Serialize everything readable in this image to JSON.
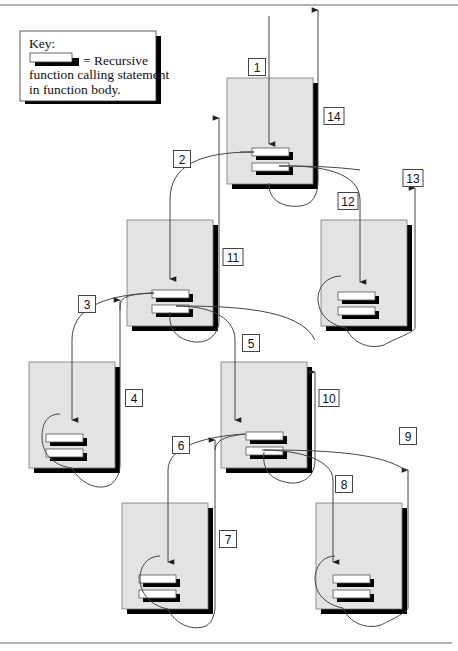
{
  "key": {
    "title": "Key:",
    "line1": "= Recursive",
    "line2": "function calling statement",
    "line3": "in function body."
  },
  "frames": [
    {
      "id": "call-1",
      "level": 1
    },
    {
      "id": "call-2",
      "level": 2
    },
    {
      "id": "call-3",
      "level": 2
    },
    {
      "id": "call-4",
      "level": 3
    },
    {
      "id": "call-5",
      "level": 3
    },
    {
      "id": "call-6",
      "level": 4
    },
    {
      "id": "call-7",
      "level": 4
    }
  ],
  "steps": [
    {
      "label": "1",
      "from": "caller",
      "to": "call-1",
      "kind": "call"
    },
    {
      "label": "2",
      "from": "call-1",
      "to": "call-2",
      "kind": "call"
    },
    {
      "label": "3",
      "from": "call-2",
      "to": "call-4",
      "kind": "call"
    },
    {
      "label": "4",
      "from": "call-4",
      "to": "call-2",
      "kind": "return"
    },
    {
      "label": "5",
      "from": "call-2",
      "to": "call-5",
      "kind": "call"
    },
    {
      "label": "6",
      "from": "call-5",
      "to": "call-6",
      "kind": "call"
    },
    {
      "label": "7",
      "from": "call-6",
      "to": "call-5",
      "kind": "return"
    },
    {
      "label": "8",
      "from": "call-5",
      "to": "call-7",
      "kind": "call"
    },
    {
      "label": "9",
      "from": "call-7",
      "to": "call-5",
      "kind": "return"
    },
    {
      "label": "10",
      "from": "call-5",
      "to": "call-2",
      "kind": "return"
    },
    {
      "label": "11",
      "from": "call-2",
      "to": "call-1",
      "kind": "return"
    },
    {
      "label": "12",
      "from": "call-1",
      "to": "call-3",
      "kind": "call"
    },
    {
      "label": "13",
      "from": "call-3",
      "to": "call-1",
      "kind": "return"
    },
    {
      "label": "14",
      "from": "call-1",
      "to": "caller",
      "kind": "return"
    }
  ]
}
